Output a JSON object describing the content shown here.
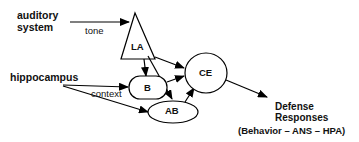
{
  "diagram": {
    "inputs": {
      "auditory": {
        "line1": "auditory",
        "line2": "system"
      },
      "hippocampus": "hippocampus"
    },
    "edge_labels": {
      "tone": "tone",
      "context": "context"
    },
    "nodes": {
      "LA": "LA",
      "B": "B",
      "AB": "AB",
      "CE": "CE"
    },
    "output": {
      "line1": "Defense",
      "line2": "Responses",
      "line3": "(Behavior – ANS  – HPA)"
    },
    "edges": [
      {
        "from": "auditory system",
        "to": "LA",
        "label": "tone"
      },
      {
        "from": "hippocampus",
        "to": "B",
        "label": "context"
      },
      {
        "from": "hippocampus",
        "to": "AB"
      },
      {
        "from": "LA",
        "to": "B"
      },
      {
        "from": "LA",
        "to": "AB"
      },
      {
        "from": "LA",
        "to": "CE"
      },
      {
        "from": "B",
        "to": "CE"
      },
      {
        "from": "AB",
        "to": "CE"
      },
      {
        "from": "CE",
        "to": "Defense Responses"
      }
    ]
  }
}
